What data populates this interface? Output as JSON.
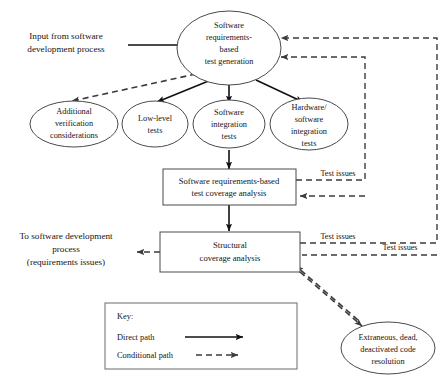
{
  "diagram": {
    "colors": {
      "background": "#ffffff",
      "node_stroke": "#4a4a4a",
      "solid_edge": "#111111",
      "dashed_edge": "#3b3b3b",
      "text": "#141414"
    },
    "io_labels": {
      "input": [
        "Input from software",
        "development process"
      ],
      "output": [
        "To software development",
        "process",
        "(requirements issues)"
      ]
    },
    "nodes": {
      "test_generation": [
        "Software",
        "requirements-",
        "based",
        "test generation"
      ],
      "additional_verification": [
        "Additional",
        "verification",
        "considerations"
      ],
      "low_level_tests": [
        "Low-level",
        "tests"
      ],
      "software_integration_tests": [
        "Software",
        "integration",
        "tests"
      ],
      "hardware_software_integration_tests": [
        "Hardware/",
        "software",
        "integration",
        "tests"
      ],
      "requirements_coverage_analysis": [
        "Software requirements-based",
        "test coverage analysis"
      ],
      "structural_coverage_analysis": [
        "Structural",
        "coverage analysis"
      ],
      "extraneous_code_resolution": [
        "Extraneous, dead,",
        "deactivated code",
        "resolution"
      ]
    },
    "edge_labels": {
      "test_issues_1": "Test issues",
      "test_issues_2": "Test issues",
      "test_issues_3": "Test issues"
    },
    "legend": {
      "title": "Key:",
      "direct_path": "Direct path",
      "conditional_path": "Conditional path"
    }
  }
}
